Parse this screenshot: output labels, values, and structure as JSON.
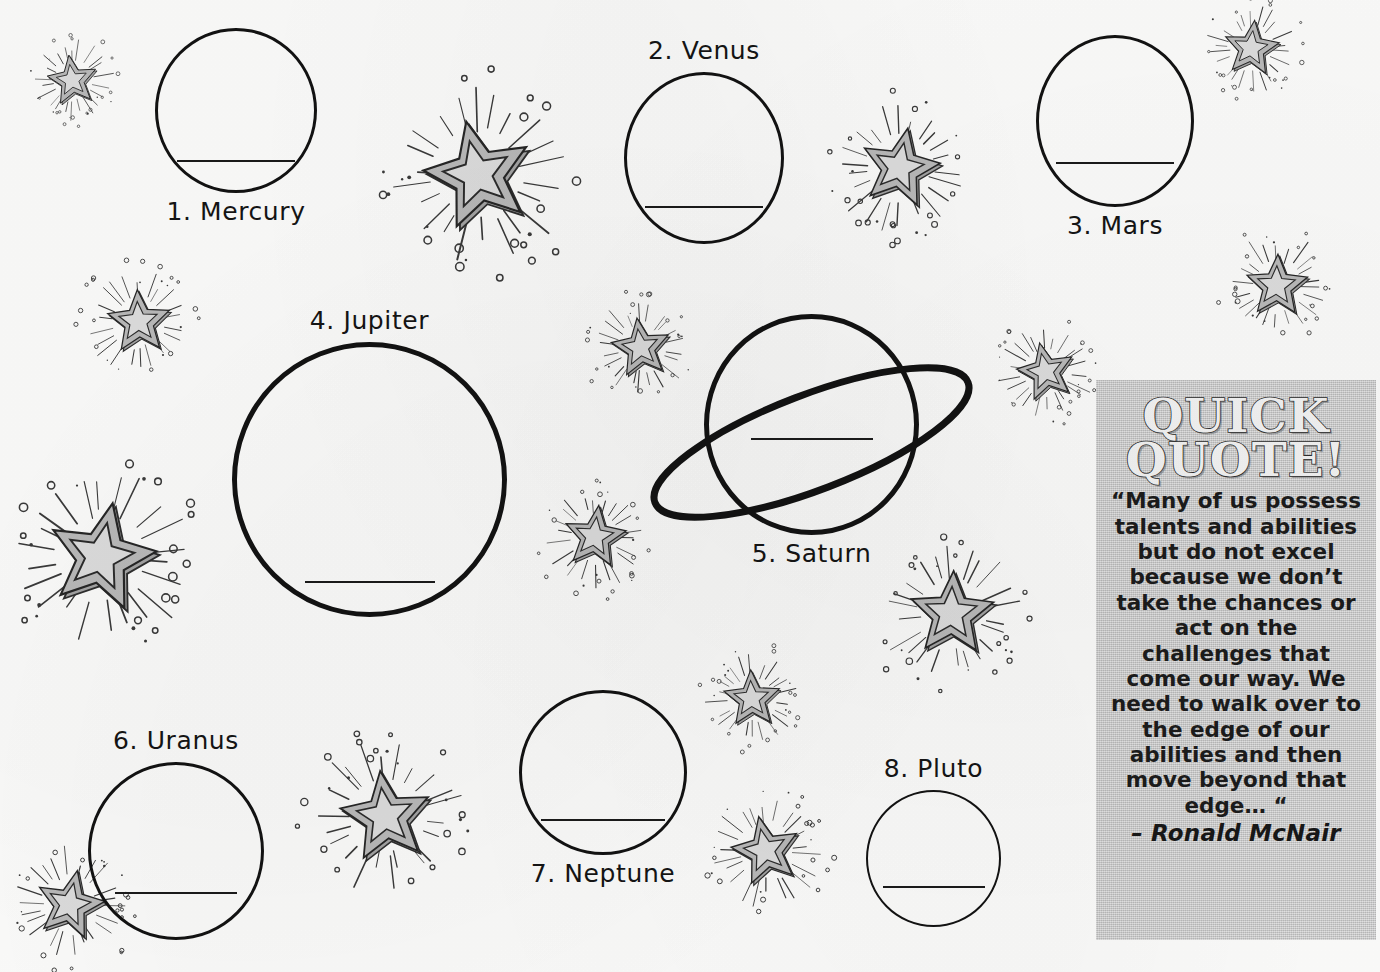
{
  "worksheet": {
    "planets": [
      {
        "label": "1. Mercury",
        "label_pos": "below",
        "shape": "circle",
        "x": 155,
        "y": 28,
        "w": 162,
        "h": 165,
        "line_w": 118,
        "line_dy": 0.8
      },
      {
        "label": "2. Venus",
        "label_pos": "above",
        "shape": "circle",
        "x": 624,
        "y": 72,
        "w": 160,
        "h": 172,
        "line_w": 118,
        "line_dy": 0.78
      },
      {
        "label": "3. Mars",
        "label_pos": "below",
        "shape": "circle",
        "x": 1036,
        "y": 35,
        "w": 158,
        "h": 172,
        "line_w": 118,
        "line_dy": 0.74
      },
      {
        "label": "4. Jupiter",
        "label_pos": "above",
        "shape": "circle",
        "x": 232,
        "y": 342,
        "w": 275,
        "h": 275,
        "line_w": 130,
        "line_dy": 0.87
      },
      {
        "label": "5. Saturn",
        "label_pos": "below",
        "shape": "ringed",
        "x": 704,
        "y": 314,
        "w": 215,
        "h": 221,
        "line_w": 122,
        "line_dy": 0.56
      },
      {
        "label": "6. Uranus",
        "label_pos": "above",
        "shape": "circle",
        "x": 88,
        "y": 762,
        "w": 176,
        "h": 178,
        "line_w": 122,
        "line_dy": 0.73
      },
      {
        "label": "7. Neptune",
        "label_pos": "below",
        "shape": "circle",
        "x": 519,
        "y": 690,
        "w": 168,
        "h": 165,
        "line_w": 124,
        "line_dy": 0.78
      },
      {
        "label": "8. Pluto",
        "label_pos": "above",
        "shape": "circle",
        "x": 866,
        "y": 790,
        "w": 135,
        "h": 137,
        "line_w": 102,
        "line_dy": 0.7
      }
    ],
    "stars": [
      {
        "x": 72,
        "y": 80,
        "size": 95
      },
      {
        "x": 478,
        "y": 175,
        "size": 205
      },
      {
        "x": 900,
        "y": 168,
        "size": 150
      },
      {
        "x": 1251,
        "y": 48,
        "size": 105
      },
      {
        "x": 1277,
        "y": 286,
        "size": 118
      },
      {
        "x": 139,
        "y": 322,
        "size": 120
      },
      {
        "x": 641,
        "y": 348,
        "size": 112
      },
      {
        "x": 1046,
        "y": 372,
        "size": 110
      },
      {
        "x": 101,
        "y": 557,
        "size": 205
      },
      {
        "x": 595,
        "y": 537,
        "size": 118
      },
      {
        "x": 952,
        "y": 614,
        "size": 160
      },
      {
        "x": 752,
        "y": 699,
        "size": 108
      },
      {
        "x": 386,
        "y": 817,
        "size": 172
      },
      {
        "x": 766,
        "y": 851,
        "size": 130
      },
      {
        "x": 70,
        "y": 905,
        "size": 130
      }
    ]
  },
  "quote": {
    "title_line1": "QUICK",
    "title_line2": "QUOTE!",
    "text": "“Many of us possess talents and abilities but do not excel because we don’t take the chances or act on the challenges that come our way. We need to walk over to the edge of our abilities and then move beyond that edge… “",
    "attribution": "– Ronald McNair"
  },
  "colors": {
    "ink": "#121212",
    "paper": "#fbfbfa",
    "quote_box_bg": "#c9c9c9",
    "star_light": "#dcdcdc",
    "star_mid": "#b9b9b9",
    "star_dark": "#a3a3a3"
  }
}
